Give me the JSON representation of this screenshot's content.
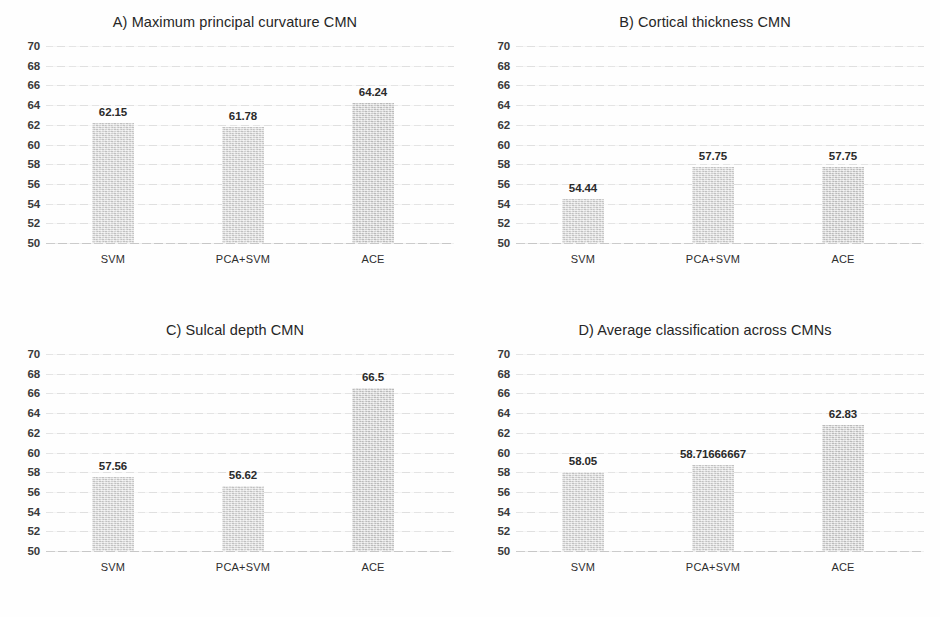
{
  "figure": {
    "background_color": "#fefefe",
    "bar_color": "#d6d6d6",
    "gridline_color": "#e3e3e3",
    "text_color": "#1a1a1a"
  },
  "chart_data": [
    {
      "type": "bar",
      "panel": "A",
      "title": "A) Maximum principal curvature CMN",
      "categories": [
        "SVM",
        "PCA+SVM",
        "ACE"
      ],
      "values": [
        62.15,
        61.78,
        64.24
      ],
      "value_labels": [
        "62.15",
        "61.78",
        "64.24"
      ],
      "xlabel": "",
      "ylabel": "",
      "ylim": [
        50,
        70
      ],
      "ytick_step": 2,
      "yticks": [
        70,
        68,
        66,
        64,
        62,
        60,
        58,
        56,
        54,
        52,
        50
      ],
      "ytick_labels": [
        "70",
        "68",
        "66",
        "64",
        "62",
        "60",
        "58",
        "56",
        "54",
        "52",
        "50"
      ],
      "grid": true,
      "legend": "none"
    },
    {
      "type": "bar",
      "panel": "B",
      "title": "B) Cortical thickness CMN",
      "categories": [
        "SVM",
        "PCA+SVM",
        "ACE"
      ],
      "values": [
        54.44,
        57.75,
        57.75
      ],
      "value_labels": [
        "54.44",
        "57.75",
        "57.75"
      ],
      "xlabel": "",
      "ylabel": "",
      "ylim": [
        50,
        70
      ],
      "ytick_step": 2,
      "yticks": [
        70,
        68,
        66,
        64,
        62,
        60,
        58,
        56,
        54,
        52,
        50
      ],
      "ytick_labels": [
        "70",
        "68",
        "66",
        "64",
        "62",
        "60",
        "58",
        "56",
        "54",
        "52",
        "50"
      ],
      "grid": true,
      "legend": "none"
    },
    {
      "type": "bar",
      "panel": "C",
      "title": "C) Sulcal depth CMN",
      "categories": [
        "SVM",
        "PCA+SVM",
        "ACE"
      ],
      "values": [
        57.56,
        56.62,
        66.5
      ],
      "value_labels": [
        "57.56",
        "56.62",
        "66.5"
      ],
      "xlabel": "",
      "ylabel": "",
      "ylim": [
        50,
        70
      ],
      "ytick_step": 2,
      "yticks": [
        70,
        68,
        66,
        64,
        62,
        60,
        58,
        56,
        54,
        52,
        50
      ],
      "ytick_labels": [
        "70",
        "68",
        "66",
        "64",
        "62",
        "60",
        "58",
        "56",
        "54",
        "52",
        "50"
      ],
      "grid": true,
      "legend": "none"
    },
    {
      "type": "bar",
      "panel": "D",
      "title": "D) Average classification across CMNs",
      "categories": [
        "SVM",
        "PCA+SVM",
        "ACE"
      ],
      "values": [
        58.05,
        58.71666667,
        62.83
      ],
      "value_labels": [
        "58.05",
        "58.71666667",
        "62.83"
      ],
      "xlabel": "",
      "ylabel": "",
      "ylim": [
        50,
        70
      ],
      "ytick_step": 2,
      "yticks": [
        70,
        68,
        66,
        64,
        62,
        60,
        58,
        56,
        54,
        52,
        50
      ],
      "ytick_labels": [
        "70",
        "68",
        "66",
        "64",
        "62",
        "60",
        "58",
        "56",
        "54",
        "52",
        "50"
      ],
      "grid": true,
      "legend": "none"
    }
  ]
}
